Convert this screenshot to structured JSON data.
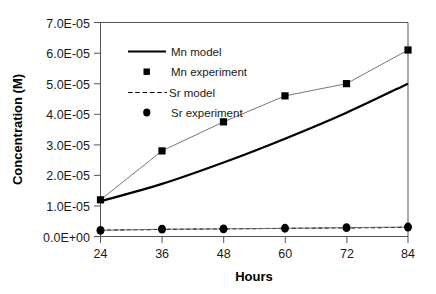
{
  "chart_data": {
    "type": "line",
    "title": "",
    "xlabel": "Hours",
    "ylabel": "Concentration (M)",
    "x": [
      24,
      36,
      48,
      60,
      72,
      84
    ],
    "xlim": [
      24,
      84
    ],
    "ylim": [
      0,
      7e-05
    ],
    "grid": false,
    "legend_position": "upper-left-inside",
    "xtick_labels": [
      "24",
      "36",
      "48",
      "60",
      "72",
      "84"
    ],
    "ytick_labels": [
      "0.0E+00",
      "1.0E-05",
      "2.0E-05",
      "3.0E-05",
      "4.0E-05",
      "5.0E-05",
      "6.0E-05",
      "7.0E-05"
    ],
    "ytick_values": [
      0,
      1e-05,
      2e-05,
      3e-05,
      4e-05,
      5e-05,
      6e-05,
      7e-05
    ],
    "series": [
      {
        "name": "Mn  model",
        "style": "solid-line",
        "marker": "none",
        "color": "#000000",
        "linewidth": 2.2,
        "values": [
          1.15e-05,
          1.72e-05,
          2.42e-05,
          3.2e-05,
          4.05e-05,
          5e-05
        ]
      },
      {
        "name": "Mn  experiment",
        "style": "thin-line-with-markers",
        "marker": "square",
        "color": "#000000",
        "linewidth": 0.9,
        "values": [
          1.2e-05,
          2.8e-05,
          3.75e-05,
          4.6e-05,
          5e-05,
          6.1e-05
        ]
      },
      {
        "name": "Sr  model",
        "style": "dashed-line",
        "marker": "none",
        "color": "#000000",
        "linewidth": 1.1,
        "values": [
          2.1e-06,
          2.3e-06,
          2.5e-06,
          2.65e-06,
          2.8e-06,
          3e-06
        ]
      },
      {
        "name": "Sr  experiment",
        "style": "thin-line-with-markers",
        "marker": "circle",
        "color": "#000000",
        "linewidth": 0.9,
        "values": [
          2e-06,
          2.4e-06,
          2.5e-06,
          2.7e-06,
          2.9e-06,
          3.1e-06
        ]
      }
    ]
  },
  "legend": {
    "entries": [
      {
        "label": "Mn  model",
        "marker": "solid-line"
      },
      {
        "label": "Mn  experiment",
        "marker": "square"
      },
      {
        "label": "Sr  model",
        "marker": "dashed-line"
      },
      {
        "label": "Sr  experiment",
        "marker": "circle"
      }
    ]
  }
}
